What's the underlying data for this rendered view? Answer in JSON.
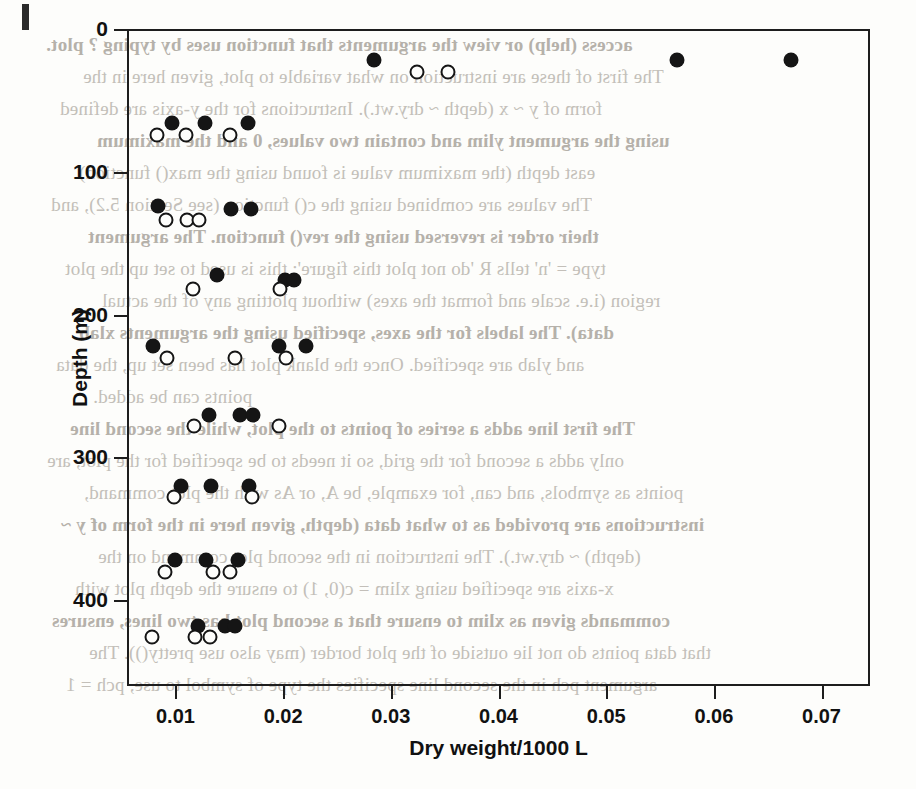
{
  "page": {
    "edge_mark": "black-page-edge-marker",
    "ghost_text_lines": [
      "access (help) or view the arguments that function uses by typing ? plot.",
      "The first of these are instruction on what variable to plot, given here in the",
      "form of y ~ x (depth ~ dry.wt.). Instructions for the y-axis are defined",
      "using the argument ylim and contain two values, 0 and the maximum",
      "east depth (the maximum value is found using the max() function).",
      "The values are combined using the c() function (see Section 5.2), and",
      "their order is reversed using the rev() function. The argument",
      "type = 'n' tells R 'do not plot this figure'; this is used to set up the plot",
      "region (i.e. scale and format the axes) without plotting any of the actual",
      "data). The labels for the axes, specified using the arguments xlab",
      "and ylab are specified. Once the blank plot has been set up, the data",
      "points can be added.",
      "The first line adds a series of points to the plot, while the second line",
      "only adds a second for the grid, so it needs to be specified for the plot, are",
      "points as symbols, and can, for example, be A, or As with the plot command,",
      "instructions are provided as to what data (depth, given here in the form of y ~",
      "(depth) ~ dry.wt.). The instruction in the second plot command on the",
      "x-axis are specified using xlim = c(0, 1) to ensure the depth plot with",
      "commands given as xlim to ensure that a second plot has two lines, ensures",
      "that data points do not lie outside of the plot border (may also use pretty()). The",
      "argument pch in the second line specifies the type of symbol to use, pch = 1"
    ]
  },
  "chart_data": {
    "type": "scatter",
    "title": "",
    "xlabel": "Dry weight/1000 L",
    "ylabel": "Depth (m)",
    "xlim": [
      0.0055,
      0.0745
    ],
    "ylim": [
      0,
      460
    ],
    "y_inverted": true,
    "grid": false,
    "xticks": [
      0.01,
      0.02,
      0.03,
      0.04,
      0.05,
      0.06,
      0.07
    ],
    "xticklabels": [
      "0.01",
      "0.02",
      "0.03",
      "0.04",
      "0.05",
      "0.06",
      "0.07"
    ],
    "yticks": [
      0,
      100,
      200,
      300,
      400
    ],
    "yticklabels": [
      "0",
      "100",
      "200",
      "300",
      "400"
    ],
    "series": [
      {
        "name": "filled-circles",
        "marker": "filled-circle",
        "color": "#151515",
        "points": [
          {
            "x": 0.0284,
            "y": 22
          },
          {
            "x": 0.0566,
            "y": 22
          },
          {
            "x": 0.0672,
            "y": 22
          },
          {
            "x": 0.0097,
            "y": 66
          },
          {
            "x": 0.0127,
            "y": 66
          },
          {
            "x": 0.0167,
            "y": 66
          },
          {
            "x": 0.0084,
            "y": 124
          },
          {
            "x": 0.0152,
            "y": 126
          },
          {
            "x": 0.017,
            "y": 126
          },
          {
            "x": 0.0139,
            "y": 172
          },
          {
            "x": 0.0202,
            "y": 176
          },
          {
            "x": 0.021,
            "y": 176
          },
          {
            "x": 0.0079,
            "y": 222
          },
          {
            "x": 0.0196,
            "y": 222
          },
          {
            "x": 0.0221,
            "y": 222
          },
          {
            "x": 0.0131,
            "y": 270
          },
          {
            "x": 0.016,
            "y": 270
          },
          {
            "x": 0.0172,
            "y": 270
          },
          {
            "x": 0.0105,
            "y": 320
          },
          {
            "x": 0.0133,
            "y": 320
          },
          {
            "x": 0.0168,
            "y": 320
          },
          {
            "x": 0.01,
            "y": 372
          },
          {
            "x": 0.0128,
            "y": 372
          },
          {
            "x": 0.0158,
            "y": 372
          },
          {
            "x": 0.0121,
            "y": 418
          },
          {
            "x": 0.0146,
            "y": 418
          },
          {
            "x": 0.0155,
            "y": 418
          }
        ]
      },
      {
        "name": "open-circles",
        "marker": "open-circle",
        "color": "#151515",
        "points": [
          {
            "x": 0.0324,
            "y": 30
          },
          {
            "x": 0.0353,
            "y": 30
          },
          {
            "x": 0.0083,
            "y": 74
          },
          {
            "x": 0.011,
            "y": 74
          },
          {
            "x": 0.0151,
            "y": 74
          },
          {
            "x": 0.0091,
            "y": 134
          },
          {
            "x": 0.0111,
            "y": 134
          },
          {
            "x": 0.0122,
            "y": 134
          },
          {
            "x": 0.0116,
            "y": 182
          },
          {
            "x": 0.0197,
            "y": 182
          },
          {
            "x": 0.0092,
            "y": 230
          },
          {
            "x": 0.0155,
            "y": 230
          },
          {
            "x": 0.0203,
            "y": 230
          },
          {
            "x": 0.0117,
            "y": 278
          },
          {
            "x": 0.0196,
            "y": 278
          },
          {
            "x": 0.0099,
            "y": 328
          },
          {
            "x": 0.0171,
            "y": 328
          },
          {
            "x": 0.009,
            "y": 380
          },
          {
            "x": 0.0135,
            "y": 380
          },
          {
            "x": 0.0151,
            "y": 380
          },
          {
            "x": 0.0078,
            "y": 426
          },
          {
            "x": 0.0118,
            "y": 426
          },
          {
            "x": 0.0132,
            "y": 426
          }
        ]
      }
    ]
  }
}
